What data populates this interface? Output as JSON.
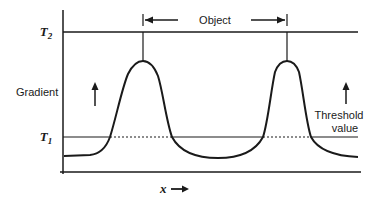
{
  "diagram": {
    "title": "",
    "labels": {
      "t2": "T",
      "t2_sub": "2",
      "t1": "T",
      "t1_sub": "1",
      "y_axis": "Gradient",
      "x_axis": "x",
      "object": "Object",
      "threshold_line1": "Threshold",
      "threshold_line2": "value"
    },
    "elements": {
      "y_axis": {
        "x": 63,
        "y_top": 10,
        "y_bottom": 174
      },
      "x_axis": {
        "y": 172,
        "x_start": 60,
        "x_end": 361
      },
      "t2_line": {
        "y": 32,
        "x_start": 63,
        "x_end": 358
      },
      "t1_line": {
        "y": 137,
        "x_start": 63,
        "x_end": 358
      },
      "peaks": [
        {
          "x": 143,
          "y_top": 61
        },
        {
          "x": 287,
          "y_top": 61
        }
      ],
      "object_span": {
        "x_start": 143,
        "x_end": 287,
        "y": 20
      }
    },
    "colors": {
      "ink": "#1a1a1a",
      "background": "#ffffff"
    }
  }
}
